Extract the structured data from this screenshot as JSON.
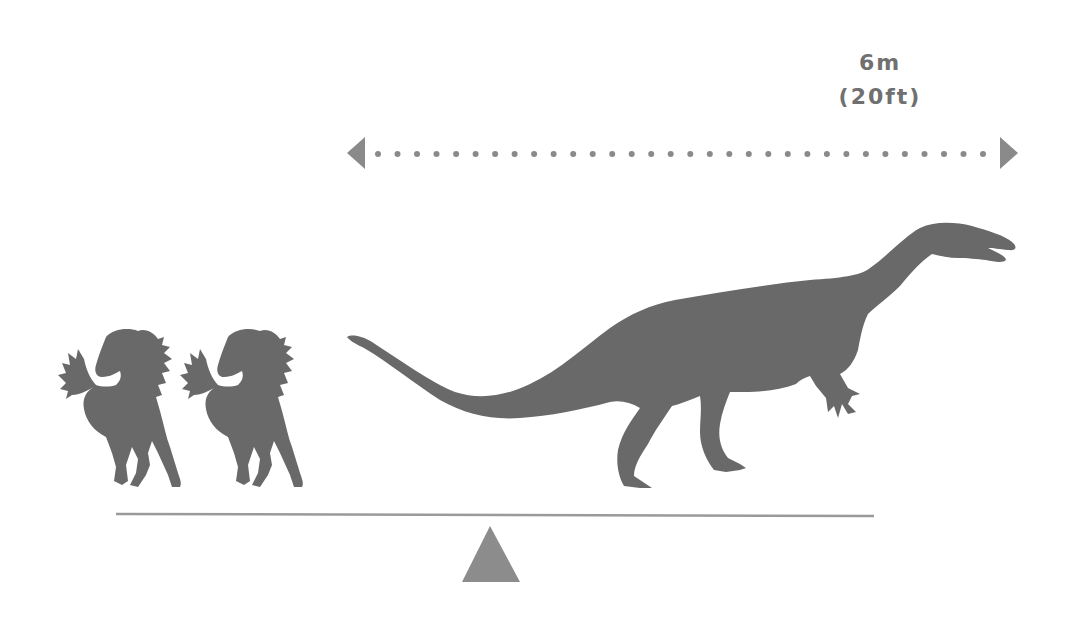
{
  "diagram": {
    "type": "size-comparison-balance",
    "colors": {
      "silhouette": "#696969",
      "arrow": "#8a8a8a",
      "beam": "#9a9a9a",
      "fulcrum": "#8c8c8c",
      "text": "#707070",
      "background": "#ffffff"
    },
    "measurement": {
      "metric": "6m",
      "imperial": "(20ft)",
      "arrow_style": "dotted double-headed arrow",
      "dot_count": 32
    },
    "left_side": {
      "label": "horses",
      "count": 2,
      "icon": "horse-icon"
    },
    "right_side": {
      "label": "dinosaur",
      "count": 1,
      "icon": "dinosaur-icon"
    },
    "balance": {
      "beam": "seesaw-beam",
      "fulcrum": "fulcrum-triangle"
    }
  }
}
